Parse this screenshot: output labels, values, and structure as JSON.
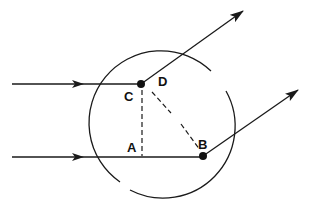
{
  "diagram": {
    "labels": {
      "A": "A",
      "B": "B",
      "C": "C",
      "D": "D"
    },
    "points": {
      "C": {
        "x": 141,
        "y": 84
      },
      "B": {
        "x": 203,
        "y": 156
      },
      "A": {
        "x": 141,
        "y": 157
      },
      "D": {
        "x": 152,
        "y": 91
      }
    },
    "rays": [
      {
        "name": "incident-ray-upper",
        "from": [
          12,
          84
        ],
        "to": [
          141,
          84
        ]
      },
      {
        "name": "incident-ray-lower",
        "from": [
          12,
          157
        ],
        "to": [
          203,
          157
        ]
      },
      {
        "name": "scattered-ray-upper",
        "from": [
          141,
          84
        ],
        "to": [
          243,
          11
        ]
      },
      {
        "name": "scattered-ray-lower",
        "from": [
          203,
          156
        ],
        "to": [
          298,
          90
        ]
      }
    ],
    "circle": {
      "cx": 164,
      "cy": 125,
      "r": 72
    },
    "colors": {
      "stroke": "#1a1a1a",
      "background": "#ffffff"
    }
  }
}
